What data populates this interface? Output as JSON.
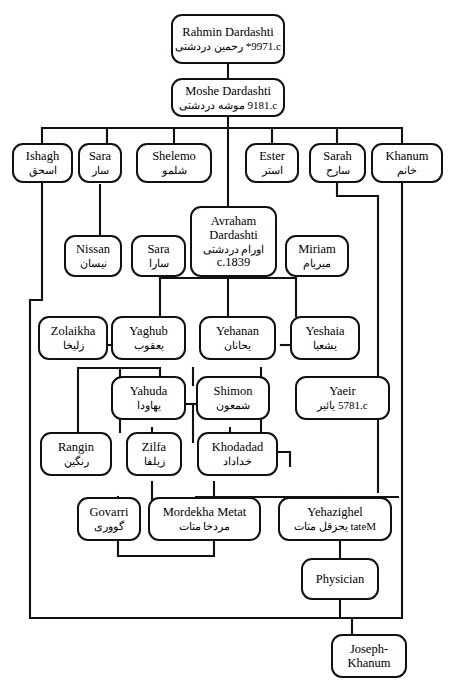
{
  "diagram": {
    "type": "genealogy-tree",
    "line_color": "#111111",
    "box_fill": "#ffffff",
    "generations": 8
  },
  "nodes": [
    {
      "id": "rahmin",
      "en": "Rahmin Dardashti",
      "en2": "",
      "fa": "رحمین دردشتی",
      "date": "c.1799",
      "note": "*",
      "fa_line": "c.1799*  رحمین دردشتی"
    },
    {
      "id": "moshe",
      "en": "Moshe Dardashti",
      "en2": "",
      "fa": "موشه دردشتی",
      "date": "c.1819",
      "note": "",
      "fa_line": "c.1819  موشه دردشتی"
    },
    {
      "id": "ishagh",
      "en": "Ishagh",
      "en2": "",
      "fa": "اسحق",
      "date": "",
      "note": "",
      "fa_line": "اسحق"
    },
    {
      "id": "sara1",
      "en": "Sara",
      "en2": "",
      "fa": "سار",
      "date": "",
      "note": "",
      "fa_line": "سار"
    },
    {
      "id": "shelemo",
      "en": "Shelemo",
      "en2": "",
      "fa": "شلمو",
      "date": "",
      "note": "",
      "fa_line": "شلمو"
    },
    {
      "id": "ester",
      "en": "Ester",
      "en2": "",
      "fa": "استر",
      "date": "",
      "note": "",
      "fa_line": "استر"
    },
    {
      "id": "sarah",
      "en": "Sarah",
      "en2": "",
      "fa": "سارح",
      "date": "",
      "note": "",
      "fa_line": "سارح"
    },
    {
      "id": "khanum",
      "en": "Khanum",
      "en2": "",
      "fa": "خانم",
      "date": "",
      "note": "",
      "fa_line": "خانم"
    },
    {
      "id": "nissan",
      "en": "Nissan",
      "en2": "",
      "fa": "نیسان",
      "date": "",
      "note": "",
      "fa_line": "نیسان"
    },
    {
      "id": "sara2",
      "en": "Sara",
      "en2": "",
      "fa": "سارا",
      "date": "",
      "note": "",
      "fa_line": "سارا"
    },
    {
      "id": "avraham",
      "en": "Avraham",
      "en2": "Dardashti",
      "fa": "اورام دردشتی",
      "date": "c.1839",
      "note": "",
      "fa_line": "اورام دردشتی"
    },
    {
      "id": "miriam",
      "en": "Miriam",
      "en2": "",
      "fa": "میریام",
      "date": "",
      "note": "",
      "fa_line": "میریام"
    },
    {
      "id": "zolaikha",
      "en": "Zolaikha",
      "en2": "",
      "fa": "زلیخا",
      "date": "",
      "note": "",
      "fa_line": "زلیخا"
    },
    {
      "id": "yaghub",
      "en": "Yaghub",
      "en2": "",
      "fa": "یعقوب",
      "date": "",
      "note": "",
      "fa_line": "یعقوب"
    },
    {
      "id": "yehanan",
      "en": "Yehanan",
      "en2": "",
      "fa": "یحانان",
      "date": "",
      "note": "",
      "fa_line": "یحانان"
    },
    {
      "id": "yeshaia",
      "en": "Yeshaia",
      "en2": "",
      "fa": "یشعیا",
      "date": "",
      "note": "",
      "fa_line": "یشعیا"
    },
    {
      "id": "yahuda",
      "en": "Yahuda",
      "en2": "",
      "fa": "یهاودا",
      "date": "",
      "note": "",
      "fa_line": "یهاودا"
    },
    {
      "id": "shimon",
      "en": "Shimon",
      "en2": "",
      "fa": "شمعون",
      "date": "",
      "note": "",
      "fa_line": "شمعون"
    },
    {
      "id": "yaeir",
      "en": "Yaeir",
      "en2": "",
      "fa": "یائیر",
      "date": "c.1875",
      "note": "",
      "fa_line": "c.1875 یائیر"
    },
    {
      "id": "rangin",
      "en": "Rangin",
      "en2": "",
      "fa": "رنگین",
      "date": "",
      "note": "",
      "fa_line": "رنگین"
    },
    {
      "id": "zilfa",
      "en": "Zilfa",
      "en2": "",
      "fa": "زیلفا",
      "date": "",
      "note": "",
      "fa_line": "زیلفا"
    },
    {
      "id": "khodadad",
      "en": "Khodadad",
      "en2": "",
      "fa": "خداداد",
      "date": "",
      "note": "",
      "fa_line": "خداداد"
    },
    {
      "id": "govarri",
      "en": "Govarri",
      "en2": "",
      "fa": "گووری",
      "date": "",
      "note": "",
      "fa_line": "گووری"
    },
    {
      "id": "mordekha",
      "en": "Mordekha Metat",
      "en2": "",
      "fa": "مردخا متات",
      "date": "",
      "note": "",
      "fa_line": "مردخا متات"
    },
    {
      "id": "yehazighel",
      "en": "Yehazighel",
      "en2": "Metat",
      "fa": "یحزقل متات",
      "date": "",
      "note": "",
      "fa_line": "Metat  یحزقل متات"
    },
    {
      "id": "physician",
      "en": "Physician",
      "en2": "",
      "fa": "",
      "date": "",
      "note": "",
      "fa_line": ""
    },
    {
      "id": "josephkhanum",
      "en": "Joseph-",
      "en2": "Khanum",
      "fa": "",
      "date": "",
      "note": "",
      "fa_line": ""
    }
  ]
}
